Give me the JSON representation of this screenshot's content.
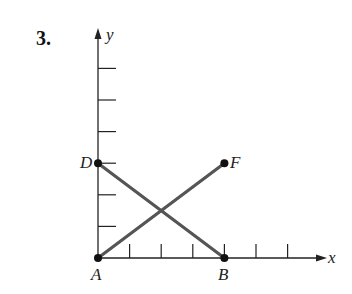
{
  "problem_number": "3.",
  "axes": {
    "x_label": "x",
    "y_label": "y",
    "origin_px": [
      98,
      258
    ],
    "unit_px": 31.6,
    "x_ticks": [
      1,
      2,
      3,
      4,
      5,
      6
    ],
    "y_ticks": [
      1,
      2,
      3,
      4,
      5,
      6
    ]
  },
  "points": [
    {
      "name": "A",
      "x": 0,
      "y": 0
    },
    {
      "name": "B",
      "x": 4,
      "y": 0
    },
    {
      "name": "D",
      "x": 0,
      "y": 3
    },
    {
      "name": "F",
      "x": 4,
      "y": 3
    }
  ],
  "segments": [
    {
      "from": "D",
      "to": "B"
    },
    {
      "from": "A",
      "to": "F"
    }
  ],
  "colors": {
    "axis": "#222222",
    "segment": "#555555",
    "point": "#111111"
  }
}
